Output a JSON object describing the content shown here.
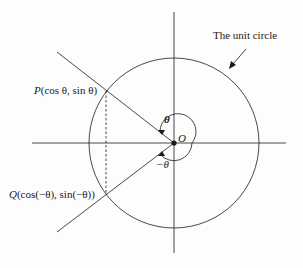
{
  "diagram": {
    "title_label": "The unit circle",
    "origin_label": "O",
    "angle_pos_label": "θ",
    "angle_neg_label": "−θ",
    "point_p": {
      "name": "P",
      "coords": "(cos θ, sin θ)"
    },
    "point_q": {
      "name": "Q",
      "coords": "(cos(−θ), sin(−θ))"
    },
    "colors": {
      "stroke": "#1a1a1a",
      "background": "#fdfdfd"
    }
  }
}
